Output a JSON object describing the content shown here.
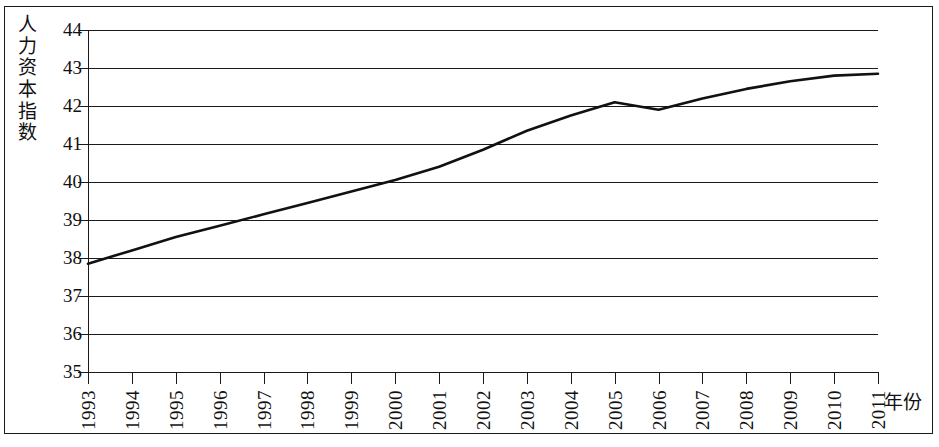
{
  "chart_data": {
    "type": "line",
    "title": "",
    "xlabel": "年份",
    "ylabel": "人力资本指数",
    "ylim": [
      35,
      44
    ],
    "xlim": [
      1993,
      2011
    ],
    "grid": true,
    "legend": null,
    "y_ticks": [
      44,
      43,
      42,
      41,
      40,
      39,
      38,
      37,
      36,
      35
    ],
    "x_ticks": [
      "1993",
      "1994",
      "1995",
      "1996",
      "1997",
      "1998",
      "1999",
      "2000",
      "2001",
      "2002",
      "2003",
      "2004",
      "2005",
      "2006",
      "2007",
      "2008",
      "2009",
      "2010",
      "2011"
    ],
    "categories": [
      1993,
      1994,
      1995,
      1996,
      1997,
      1998,
      1999,
      2000,
      2001,
      2002,
      2003,
      2004,
      2005,
      2006,
      2007,
      2008,
      2009,
      2010,
      2011
    ],
    "values": [
      37.85,
      38.2,
      38.55,
      38.85,
      39.15,
      39.45,
      39.75,
      40.05,
      40.4,
      40.85,
      41.35,
      41.75,
      42.1,
      41.9,
      42.2,
      42.45,
      42.65,
      42.8,
      42.85
    ],
    "series_name": "人力资本指数",
    "line_color": "#111111"
  },
  "axis": {
    "y_label_chars": [
      "人",
      "力",
      "资",
      "本",
      "指",
      "数"
    ],
    "x_label_text": "年份"
  },
  "style": {
    "frame_color": "#1a1a1a",
    "background": "#ffffff"
  }
}
